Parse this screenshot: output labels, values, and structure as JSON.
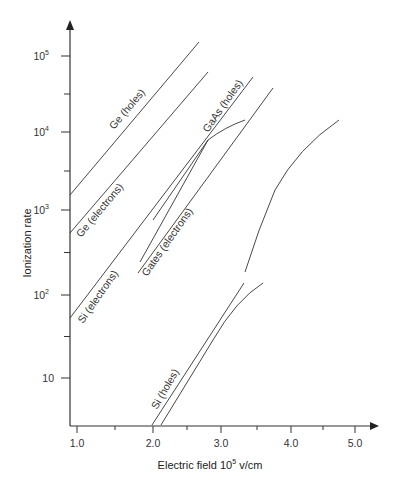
{
  "chart_data": {
    "type": "line",
    "title": "",
    "xlabel": "Electric field 10^5 v/cm",
    "xlabel_main": "Electric field 10",
    "xlabel_sup": "5",
    "xlabel_unit": " v/cm",
    "ylabel": "Ionization rate",
    "yscale": "log",
    "xlim": [
      0.9,
      5.3
    ],
    "ylim": [
      2.7,
      300000
    ],
    "grid": false,
    "legend": "inline labels on curves",
    "x_ticks": [
      {
        "value": 1.0,
        "label": "1.0",
        "major": true
      },
      {
        "value": 1.5,
        "label": "",
        "major": false
      },
      {
        "value": 2.0,
        "label": "2.0",
        "major": true
      },
      {
        "value": 2.5,
        "label": "",
        "major": false
      },
      {
        "value": 3.0,
        "label": "3.0",
        "major": true
      },
      {
        "value": 3.5,
        "label": "",
        "major": false
      },
      {
        "value": 4.0,
        "label": "4.0",
        "major": true
      },
      {
        "value": 4.5,
        "label": "",
        "major": false
      },
      {
        "value": 5.0,
        "label": "5.0",
        "major": true
      }
    ],
    "y_ticks": [
      {
        "value": 100000,
        "label": "10",
        "sup": "5",
        "major": true
      },
      {
        "value": 31623,
        "label": "",
        "sup": "",
        "major": false
      },
      {
        "value": 10000,
        "label": "10",
        "sup": "4",
        "major": true
      },
      {
        "value": 3162,
        "label": "",
        "sup": "",
        "major": false
      },
      {
        "value": 1000,
        "label": "10",
        "sup": "3",
        "major": true
      },
      {
        "value": 316,
        "label": "",
        "sup": "",
        "major": false
      },
      {
        "value": 100,
        "label": "10",
        "sup": "2",
        "major": true
      },
      {
        "value": 31.6,
        "label": "",
        "sup": "",
        "major": false
      },
      {
        "value": 10,
        "label": "10",
        "sup": "",
        "major": true
      }
    ],
    "series": [
      {
        "name": "Ge (holes)",
        "x": [
          0.91,
          2.6
        ],
        "y": [
          1600,
          150000
        ]
      },
      {
        "name": "Ge (electrons)",
        "x": [
          0.91,
          2.72
        ],
        "y": [
          500,
          60000
        ]
      },
      {
        "name": "Si (electrons)",
        "x": [
          0.91,
          3.45
        ],
        "y": [
          52,
          53000
        ]
      },
      {
        "name": "GaAs (holes)",
        "x": [
          2.0,
          2.8,
          3.35
        ],
        "y": [
          750,
          9000,
          14000
        ]
      },
      {
        "name": "GaAs (holes) line",
        "x": [
          2.5,
          2.8,
          3.45
        ],
        "y": [
          1700,
          9000,
          53000
        ]
      },
      {
        "name": "Gates (electrons)",
        "x": [
          1.8,
          3.75
        ],
        "y": [
          180,
          38000
        ]
      },
      {
        "name": "unlabeled curve",
        "x": [
          3.35,
          3.55,
          4.05,
          4.75
        ],
        "y": [
          190,
          700,
          3900,
          14000
        ]
      },
      {
        "name": "Si (holes)",
        "x": [
          1.98,
          2.85,
          3.33
        ],
        "y": [
          2.7,
          25,
          140
        ]
      },
      {
        "name": "Si (holes) curve",
        "x": [
          2.12,
          2.85,
          3.6
        ],
        "y": [
          2.7,
          25,
          140
        ]
      }
    ]
  },
  "labels": {
    "ge_holes": "Ge (holes)",
    "ge_electrons": "Ge (electrons)",
    "si_electrons": "Si (electrons)",
    "gaas_holes": "GaAs (holes)",
    "gates_electrons": "Gates (electrons)",
    "si_holes": "Si (holes)"
  }
}
